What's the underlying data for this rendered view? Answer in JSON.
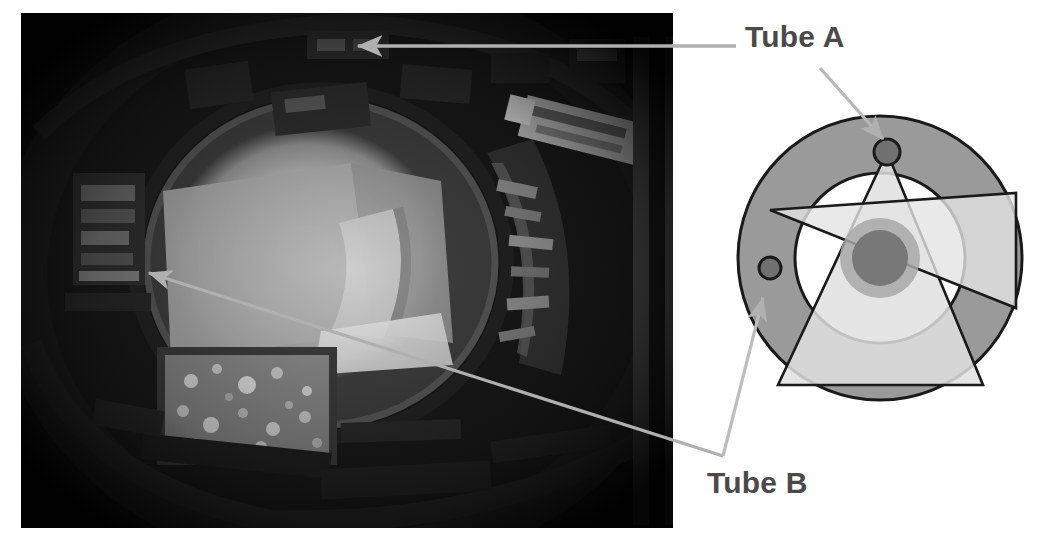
{
  "figure": {
    "type": "annotated-photo-with-schematic",
    "background_color": "#ffffff",
    "width": 1058,
    "height": 536
  },
  "labels": {
    "tube_a": "Tube A",
    "tube_b": "Tube B",
    "label_color": "#4a4a4a",
    "label_font_size_px": 30
  },
  "photo": {
    "name": "fisheye-interior-photograph",
    "description": "Dark grayscale fisheye photograph of a cylindrical machine interior with a bright illuminated circular aperture at center",
    "x": 21,
    "y": 13,
    "width": 652,
    "height": 515,
    "dominant_colors": [
      "#0d0d0d",
      "#2b2b2b",
      "#6e6e6e",
      "#b9b9b9",
      "#d7d7d7"
    ]
  },
  "diagram": {
    "name": "tube-cross-section-schematic",
    "center_x": 880,
    "center_y": 258,
    "outer_circle_radius": 142,
    "inner_circle_radius": 85,
    "core_outer_radius": 40,
    "core_inner_radius": 28,
    "tube_a_dot": {
      "cx": 887,
      "cy": 152,
      "r": 13
    },
    "tube_b_dot": {
      "cx": 770,
      "cy": 268,
      "r": 11
    },
    "colors": {
      "outer_ring_fill": "#9a9a9a",
      "inner_disc_fill": "#ffffff",
      "beam_fill": "#e3e3e3",
      "core_halo_fill": "#a8a8a8",
      "core_fill": "#787878",
      "dot_fill": "#707070",
      "stroke": "#1a1a1a",
      "leader_color": "#b0b0b0"
    }
  },
  "leaders": [
    {
      "name": "leader-tube-a-to-photo",
      "from_label": "Tube A",
      "target": "photo",
      "x1": 736,
      "y1": 46,
      "x2": 355,
      "y2": 46,
      "arrowhead": "end"
    },
    {
      "name": "leader-tube-a-to-diagram",
      "from_label": "Tube A",
      "target": "diagram",
      "x1": 820,
      "y1": 68,
      "x2": 884,
      "y2": 140,
      "arrowhead": "end"
    },
    {
      "name": "leader-tube-b-to-photo",
      "from_label": "Tube B",
      "target": "photo",
      "x1": 723,
      "y1": 456,
      "x2": 146,
      "y2": 272,
      "arrowhead": "end"
    },
    {
      "name": "leader-tube-b-to-diagram",
      "from_label": "Tube B",
      "target": "diagram",
      "x1": 723,
      "y1": 456,
      "x2": 764,
      "y2": 297,
      "arrowhead": "end"
    }
  ]
}
